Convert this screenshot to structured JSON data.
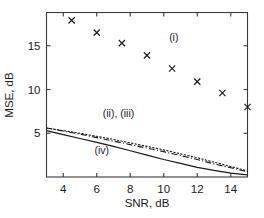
{
  "chart_data": {
    "type": "scatter",
    "title": "",
    "xlabel": "SNR, dB",
    "ylabel": "MSE, dB",
    "xlim": [
      3,
      15
    ],
    "ylim": [
      0,
      18.8
    ],
    "xticks": [
      4,
      6,
      8,
      10,
      12,
      14
    ],
    "yticks": [
      5,
      10,
      15
    ],
    "xticklabels": [
      "4",
      "6",
      "8",
      "10",
      "12",
      "14"
    ],
    "yticklabels": [
      "5",
      "10",
      "15"
    ],
    "grid": false,
    "legend_position": "inline-annotations",
    "annotations": [
      {
        "text": "(i)",
        "x": 10.6,
        "y": 15.6
      },
      {
        "text": "(ii), (iii)",
        "x": 7.3,
        "y": 6.9
      },
      {
        "text": "(iv)",
        "x": 6.3,
        "y": 2.6
      }
    ],
    "series": [
      {
        "name": "(i)",
        "style": "scatter",
        "marker": "x",
        "x": [
          4.5,
          6.0,
          7.5,
          9.0,
          10.5,
          12.0,
          13.5,
          15.0
        ],
        "values": [
          17.9,
          16.5,
          15.3,
          13.9,
          12.4,
          10.9,
          9.6,
          8.0
        ]
      },
      {
        "name": "(ii)",
        "style": "dotted",
        "x": [
          3.0,
          4.0,
          5.0,
          6.0,
          7.0,
          8.0,
          9.0,
          10.0,
          11.0,
          12.0,
          13.0,
          14.0,
          15.0
        ],
        "values": [
          5.6,
          5.3,
          5.0,
          4.65,
          4.3,
          3.9,
          3.5,
          3.1,
          2.65,
          2.2,
          1.7,
          1.2,
          0.7
        ]
      },
      {
        "name": "(iii)",
        "style": "dash-dot",
        "x": [
          3.0,
          4.0,
          5.0,
          6.0,
          7.0,
          8.0,
          9.0,
          10.0,
          11.0,
          12.0,
          13.0,
          14.0,
          15.0
        ],
        "values": [
          5.6,
          5.25,
          4.9,
          4.5,
          4.1,
          3.7,
          3.3,
          2.9,
          2.45,
          2.0,
          1.5,
          1.05,
          0.6
        ]
      },
      {
        "name": "(iv)",
        "style": "solid",
        "x": [
          3.0,
          4.0,
          5.0,
          6.0,
          7.0,
          8.0,
          9.0,
          10.0,
          11.0,
          12.0,
          13.0,
          14.0,
          15.0
        ],
        "values": [
          5.3,
          4.85,
          4.4,
          3.95,
          3.5,
          3.0,
          2.5,
          2.0,
          1.55,
          1.1,
          0.75,
          0.45,
          0.25
        ]
      }
    ]
  }
}
